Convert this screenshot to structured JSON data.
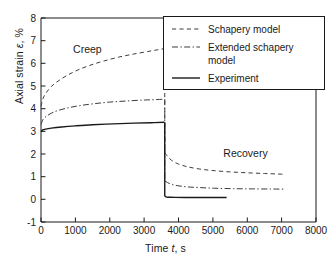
{
  "chart_data": {
    "type": "line",
    "title": "",
    "xlabel": "Time t, s",
    "ylabel": "Axial strain ε, %",
    "xlabel_plain": "Time",
    "xlabel_sym": "t",
    "xlabel_unit": ", s",
    "ylabel_plain": "Axial strain",
    "ylabel_sym": "ε",
    "ylabel_unit": ", %",
    "xlim": [
      0,
      8000
    ],
    "ylim": [
      -1,
      8
    ],
    "xticks": [
      0,
      1000,
      2000,
      3000,
      4000,
      5000,
      6000,
      7000,
      8000
    ],
    "xtick_labels": [
      "0",
      "1000",
      "2000",
      "3000",
      "4000",
      "5000",
      "6000",
      "7000",
      "8000"
    ],
    "yticks": [
      -1,
      0,
      1,
      2,
      3,
      4,
      5,
      6,
      7,
      8
    ],
    "ytick_labels": [
      "-1",
      "0",
      "1",
      "2",
      "3",
      "4",
      "5",
      "6",
      "7",
      "8"
    ],
    "grid": false,
    "legend_position": "upper right",
    "unload_time": 3600,
    "annotations": [
      {
        "text": "Creep",
        "x": 1350,
        "y": 6.45
      },
      {
        "text": "Recovery",
        "x": 5950,
        "y": 1.85
      }
    ],
    "series": [
      {
        "name": "Schapery model",
        "style": "dashed",
        "color": "#3c3c3c",
        "creep": {
          "x": [
            0,
            60,
            150,
            300,
            500,
            750,
            1050,
            1400,
            1800,
            2250,
            2700,
            3100,
            3400,
            3590
          ],
          "y": [
            4.1,
            4.45,
            4.7,
            4.98,
            5.22,
            5.46,
            5.69,
            5.9,
            6.09,
            6.27,
            6.41,
            6.52,
            6.6,
            6.65
          ]
        },
        "recovery": {
          "x": [
            3600,
            3680,
            3800,
            3980,
            4250,
            4600,
            5000,
            5500,
            6000,
            6500,
            7000,
            7100
          ],
          "y": [
            2.05,
            1.9,
            1.72,
            1.57,
            1.44,
            1.34,
            1.27,
            1.21,
            1.17,
            1.14,
            1.11,
            1.1
          ]
        }
      },
      {
        "name": "Extended schapery model",
        "name_line1": "Extended schapery",
        "name_line2": "model",
        "style": "dashdot",
        "color": "#3c3c3c",
        "creep": {
          "x": [
            0,
            60,
            150,
            300,
            500,
            800,
            1150,
            1550,
            2000,
            2500,
            3000,
            3350,
            3590
          ],
          "y": [
            3.3,
            3.52,
            3.66,
            3.8,
            3.92,
            4.04,
            4.14,
            4.22,
            4.29,
            4.34,
            4.38,
            4.4,
            4.42
          ]
        },
        "recovery": {
          "x": [
            3600,
            3680,
            3800,
            3980,
            4250,
            4600,
            5050,
            5600,
            6150,
            6700,
            7100
          ],
          "y": [
            0.82,
            0.74,
            0.66,
            0.6,
            0.55,
            0.52,
            0.49,
            0.47,
            0.46,
            0.455,
            0.45
          ]
        }
      },
      {
        "name": "Experiment",
        "style": "solid",
        "color": "#1a1a1a",
        "creep": {
          "x": [
            0,
            50,
            140,
            300,
            600,
            1000,
            1500,
            2100,
            2700,
            3200,
            3590
          ],
          "y": [
            2.98,
            3.06,
            3.1,
            3.14,
            3.19,
            3.24,
            3.29,
            3.33,
            3.36,
            3.38,
            3.4
          ]
        },
        "recovery": {
          "x": [
            3600,
            3660,
            3760,
            3900,
            4200,
            4700,
            5400
          ],
          "y": [
            0.14,
            0.1,
            0.09,
            0.085,
            0.08,
            0.08,
            0.08
          ]
        }
      }
    ]
  },
  "legend": {
    "items": [
      {
        "label": "Schapery model",
        "style": "dashed"
      },
      {
        "label": "Extended schapery",
        "label2": "model",
        "style": "dashdot"
      },
      {
        "label": "Experiment",
        "style": "solid"
      }
    ]
  }
}
